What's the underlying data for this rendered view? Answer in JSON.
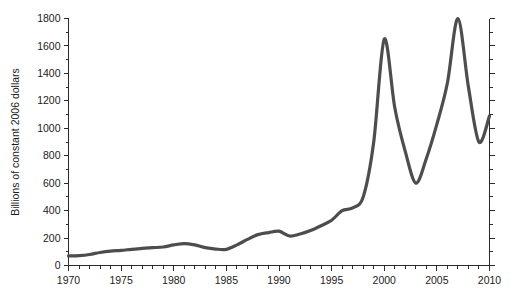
{
  "chart_data": {
    "type": "line",
    "title": "",
    "xlabel": "",
    "ylabel": "Billions of constant 2006 dollars",
    "xlim": [
      1970,
      2010
    ],
    "ylim": [
      0,
      1800
    ],
    "grid": false,
    "legend": null,
    "line_color": "#4d4d4d",
    "line_width": 3.2,
    "x_major_ticks": [
      1970,
      1975,
      1980,
      1985,
      1990,
      1995,
      2000,
      2005,
      2010
    ],
    "x_tick_labels": [
      "1970",
      "1975",
      "1980",
      "1985",
      "1990",
      "1995",
      "2000",
      "2005",
      "2010"
    ],
    "x_minor_step": 1,
    "y_major_ticks": [
      0,
      200,
      400,
      600,
      800,
      1000,
      1200,
      1400,
      1600,
      1800
    ],
    "y_tick_labels": [
      "0",
      "200",
      "400",
      "600",
      "800",
      "1000",
      "1200",
      "1400",
      "1600",
      "1800"
    ],
    "y_minor_step": 100,
    "right_axis_ticks": true,
    "right_axis_labels": false,
    "x": [
      1970,
      1971,
      1972,
      1973,
      1974,
      1975,
      1976,
      1977,
      1978,
      1979,
      1980,
      1981,
      1982,
      1983,
      1984,
      1985,
      1986,
      1987,
      1988,
      1989,
      1990,
      1991,
      1992,
      1993,
      1994,
      1995,
      1996,
      1997,
      1998,
      1999,
      2000,
      2001,
      2002,
      2003,
      2004,
      2005,
      2006,
      2007,
      2008,
      2009,
      2010
    ],
    "values": [
      70,
      72,
      80,
      95,
      105,
      110,
      118,
      125,
      130,
      135,
      150,
      160,
      150,
      130,
      120,
      118,
      150,
      190,
      225,
      240,
      250,
      215,
      230,
      255,
      290,
      330,
      400,
      420,
      500,
      900,
      1650,
      1150,
      830,
      600,
      780,
      1030,
      1330,
      1800,
      1300,
      900,
      1090
    ],
    "annotations": []
  }
}
